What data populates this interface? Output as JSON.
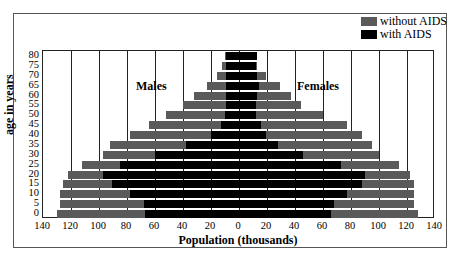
{
  "chart_data": {
    "type": "bar",
    "subtype": "population-pyramid",
    "title": "",
    "xlabel": "Population (thousands)",
    "ylabel": "age in years",
    "xlim": [
      -140,
      140
    ],
    "x_ticks": [
      "140",
      "120",
      "100",
      "80",
      "60",
      "40",
      "20",
      "0",
      "20",
      "40",
      "60",
      "80",
      "100",
      "120",
      "140"
    ],
    "categories": [
      "0",
      "5",
      "10",
      "15",
      "20",
      "25",
      "30",
      "35",
      "40",
      "45",
      "50",
      "55",
      "60",
      "65",
      "70",
      "75",
      "80"
    ],
    "panel_labels": {
      "left": "Males",
      "right": "Females"
    },
    "legend": [
      {
        "name": "without AIDS",
        "color": "#5a5a5a"
      },
      {
        "name": "with AIDS",
        "color": "#000000"
      }
    ],
    "legend_position": "top-right",
    "grid": "vertical",
    "series": [
      {
        "name": "Males without AIDS",
        "side": "left",
        "color": "#5a5a5a",
        "values": [
          130,
          128,
          128,
          126,
          122,
          112,
          97,
          92,
          78,
          64,
          52,
          40,
          32,
          23,
          16,
          12,
          10
        ]
      },
      {
        "name": "Males with AIDS",
        "side": "left",
        "color": "#000000",
        "values": [
          67,
          68,
          78,
          91,
          97,
          85,
          60,
          38,
          20,
          13,
          10,
          9,
          9,
          9,
          9,
          9,
          9
        ]
      },
      {
        "name": "Females without AIDS",
        "side": "right",
        "color": "#5a5a5a",
        "values": [
          128,
          125,
          125,
          125,
          122,
          114,
          100,
          95,
          88,
          77,
          60,
          44,
          37,
          29,
          19,
          13,
          13
        ]
      },
      {
        "name": "Females with AIDS",
        "side": "right",
        "color": "#000000",
        "values": [
          66,
          68,
          77,
          88,
          90,
          73,
          46,
          28,
          19,
          16,
          12,
          12,
          13,
          14,
          13,
          12,
          13
        ]
      }
    ]
  }
}
